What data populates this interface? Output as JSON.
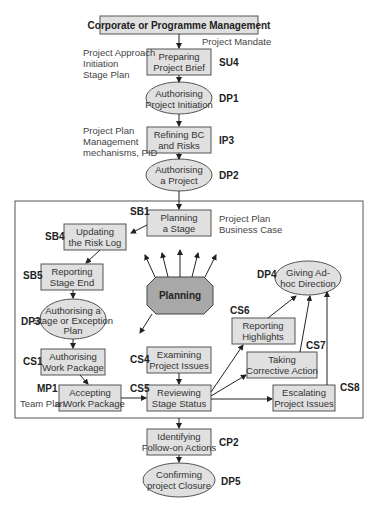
{
  "title": "Corporate or Programme Management",
  "nodes": {
    "su4": {
      "code": "SU4",
      "l1": "Preparing",
      "l2": "Project Brief"
    },
    "dp1": {
      "code": "DP1",
      "l1": "Authorising",
      "l2": "Project Initiation"
    },
    "ip3": {
      "code": "IP3",
      "l1": "Refining BC",
      "l2": "and Risks"
    },
    "dp2": {
      "code": "DP2",
      "l1": "Authorising",
      "l2": "a Project"
    },
    "sb1": {
      "code": "SB1",
      "l1": "Planning",
      "l2": "a Stage"
    },
    "sb4": {
      "code": "SB4",
      "l1": "Updating",
      "l2": "the Risk Log"
    },
    "sb5": {
      "code": "SB5",
      "l1": "Reporting",
      "l2": "Stage End"
    },
    "dp3": {
      "code": "DP3",
      "l1": "Authorising a",
      "l2": "Stage or Exception",
      "l3": "Plan"
    },
    "cs1": {
      "code": "CS1",
      "l1": "Authorising",
      "l2": "Work Package"
    },
    "mp1": {
      "code": "MP1",
      "l1": "Accepting",
      "l2": "a Work Package"
    },
    "cs4": {
      "code": "CS4",
      "l1": "Examining",
      "l2": "Project Issues"
    },
    "cs5": {
      "code": "CS5",
      "l1": "Reviewing",
      "l2": "Stage Status"
    },
    "cs6": {
      "code": "CS6",
      "l1": "Reporting",
      "l2": "Highlights"
    },
    "cs7": {
      "code": "CS7",
      "l1": "Taking",
      "l2": "Corrective Action"
    },
    "cs8": {
      "code": "CS8",
      "l1": "Escalating",
      "l2": "Project Issues"
    },
    "dp4": {
      "code": "DP4",
      "l1": "Giving Ad-",
      "l2": "hoc Direction"
    },
    "cp2": {
      "code": "CP2",
      "l1": "Identifying",
      "l2": "Follow-on Actions"
    },
    "dp5": {
      "code": "DP5",
      "l1": "Confirming",
      "l2": "project Closure"
    },
    "planning": {
      "label": "Planning"
    }
  },
  "annotations": {
    "mandate": "Project Mandate",
    "su4_side": [
      "Project Approach",
      "Initiation",
      "Stage Plan"
    ],
    "ip3_side": [
      "Project Plan",
      "Management",
      "mechanisms, PID"
    ],
    "sb1_side": [
      "Project Plan",
      "Business Case"
    ],
    "mp1_side": "Team Plan"
  },
  "colors": {
    "box_fill": "#e0e0e0",
    "planning_fill": "#a8a8a8",
    "stroke": "#555555"
  }
}
